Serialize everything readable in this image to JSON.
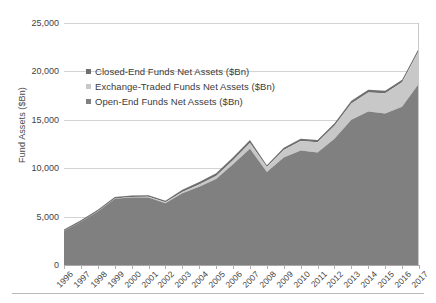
{
  "chart_data": {
    "type": "area",
    "stacked": true,
    "title": "",
    "subtitle": "",
    "xlabel": "",
    "ylabel": "Fund Assets ($Bn)",
    "ylim": [
      0,
      25000
    ],
    "ytick_labels": [
      "0",
      "5,000",
      "10,000",
      "15,000",
      "20,000",
      "25,000"
    ],
    "ytick_values": [
      0,
      5000,
      10000,
      15000,
      20000,
      25000
    ],
    "grid": true,
    "legend_position": "upper-left-inside",
    "categories": [
      "1996",
      "1997",
      "1998",
      "1999",
      "2000",
      "2001",
      "2002",
      "2003",
      "2004",
      "2005",
      "2006",
      "2007",
      "2008",
      "2009",
      "2010",
      "2011",
      "2012",
      "2013",
      "2014",
      "2015",
      "2016",
      "2017"
    ],
    "series": [
      {
        "name": "Open-End Funds Net Assets ($Bn)",
        "color": "#808080",
        "values": [
          3539,
          4468,
          5525,
          6846,
          6965,
          6975,
          6383,
          7402,
          8095,
          8891,
          10398,
          11998,
          9598,
          11113,
          11821,
          11621,
          13040,
          15013,
          15845,
          15648,
          16344,
          18746
        ]
      },
      {
        "name": "Exchange-Traded Funds Net Assets ($Bn)",
        "color": "#c8c8c8",
        "values": [
          2,
          7,
          16,
          34,
          66,
          83,
          102,
          151,
          228,
          301,
          423,
          608,
          531,
          777,
          992,
          1048,
          1337,
          1675,
          1975,
          2101,
          2524,
          3401
        ]
      },
      {
        "name": "Closed-End Funds Net Assets ($Bn)",
        "color": "#6f6f6f",
        "values": [
          128,
          152,
          156,
          147,
          143,
          141,
          159,
          214,
          253,
          277,
          298,
          315,
          188,
          224,
          241,
          243,
          265,
          279,
          289,
          261,
          262,
          275
        ]
      }
    ]
  },
  "legend": {
    "items": [
      {
        "label": "Closed-End Funds Net Assets ($Bn)",
        "color": "#6f6f6f"
      },
      {
        "label": "Exchange-Traded Funds Net Assets ($Bn)",
        "color": "#c8c8c8"
      },
      {
        "label": "Open-End Funds Net Assets ($Bn)",
        "color": "#808080"
      }
    ]
  }
}
